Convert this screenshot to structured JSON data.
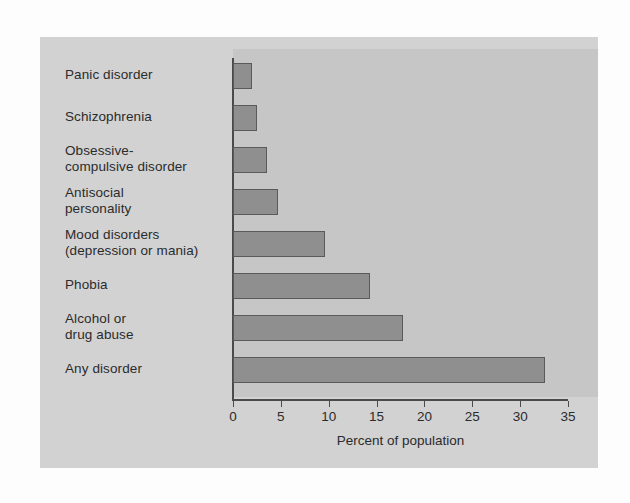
{
  "chart_data": {
    "type": "bar",
    "orientation": "horizontal",
    "title": "",
    "xlabel": "Percent of population",
    "ylabel": "",
    "xlim": [
      0,
      35
    ],
    "xticks": [
      "0",
      "5",
      "10",
      "15",
      "20",
      "25",
      "30",
      "35"
    ],
    "grid": false,
    "legend": null,
    "categories": [
      "Panic disorder",
      "Schizophrenia",
      "Obsessive-\ncompulsive disorder",
      "Antisocial\npersonality",
      "Mood disorders\n(depression or mania)",
      "Phobia",
      "Alcohol or\ndrug abuse",
      "Any disorder"
    ],
    "values": [
      2.0,
      2.5,
      3.6,
      4.7,
      9.6,
      14.3,
      17.8,
      32.6
    ],
    "bar_color": "#8f8f8f",
    "bar_edge_color": "#5a5a5a",
    "panel_color": "#d2d2d2",
    "plot_region_color": "#c6c6c6",
    "axis_color": "#4a4a4a",
    "text_color": "#2b2b2b"
  }
}
